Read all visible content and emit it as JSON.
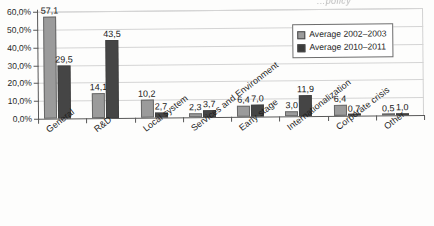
{
  "partial_title": "...policy",
  "legend": {
    "position": "top-right",
    "entries": [
      {
        "label": "Average 2002–2003",
        "color": "#9b9b9b"
      },
      {
        "label": "Average 2010–2011",
        "color": "#3c3c3c"
      }
    ]
  },
  "chart_data": {
    "type": "bar",
    "title": "",
    "subtitle": "",
    "xlabel": "",
    "ylabel": "",
    "ylim": [
      0,
      60
    ],
    "grid": true,
    "y_tick_labels": [
      "0,0%",
      "10,0%",
      "20,0%",
      "30,0%",
      "40,0%",
      "50,0%",
      "60,0%"
    ],
    "y_tick_values": [
      0,
      10,
      20,
      30,
      40,
      50,
      60
    ],
    "categories": [
      "General",
      "R&D",
      "Local system",
      "Services and Environment",
      "Early stage",
      "Internationalization",
      "Corporate crisis",
      "Other"
    ],
    "series": [
      {
        "name": "Average 2002–2003",
        "color": "#9b9b9b",
        "values": [
          57.1,
          14.1,
          10.2,
          2.3,
          6.4,
          3.0,
          6.4,
          0.5
        ],
        "labels": [
          "57,1",
          "14,1",
          "10,2",
          "2,3",
          "6,4",
          "3,0",
          "6,4",
          "0,5"
        ]
      },
      {
        "name": "Average 2010–2011",
        "color": "#3c3c3c",
        "values": [
          29.5,
          43.5,
          2.7,
          3.7,
          7.0,
          11.9,
          0.7,
          1.0
        ],
        "labels": [
          "29,5",
          "43,5",
          "2,7",
          "3,7",
          "7,0",
          "11,9",
          "0,7",
          "1,0"
        ]
      }
    ]
  }
}
